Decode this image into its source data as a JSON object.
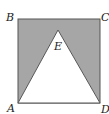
{
  "diagram": {
    "type": "geometry",
    "colors": {
      "shade": "#a6a6a6",
      "stroke": "#555555",
      "background": "#ffffff"
    },
    "points": {
      "A": {
        "label": "A",
        "x": 18,
        "y": 103
      },
      "B": {
        "label": "B",
        "x": 18,
        "y": 19
      },
      "C": {
        "label": "C",
        "x": 100,
        "y": 19
      },
      "D": {
        "label": "D",
        "x": 100,
        "y": 103
      },
      "E": {
        "label": "E",
        "x": 58,
        "y": 30
      }
    },
    "labels": {
      "A": "A",
      "B": "B",
      "C": "C",
      "D": "D",
      "E": "E"
    }
  }
}
